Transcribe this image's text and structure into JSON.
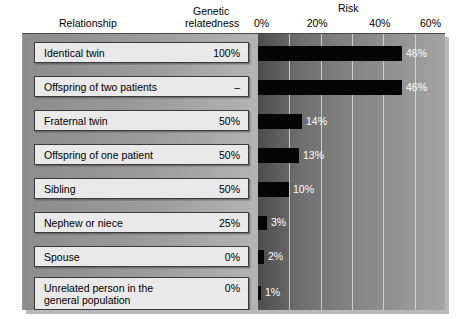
{
  "header": {
    "relationship": "Relationship",
    "genetic_line1": "Genetic",
    "genetic_line2": "relatedness",
    "risk": "Risk"
  },
  "chart_data": {
    "type": "bar",
    "orientation": "horizontal",
    "title": "Risk",
    "xlabel": "Risk",
    "ylabel": "Relationship",
    "xlim": [
      0,
      60
    ],
    "xticks": [
      "0%",
      "20%",
      "40%",
      "60%"
    ],
    "xtick_values": [
      0,
      20,
      40,
      60
    ],
    "gridlines": [
      10,
      20,
      30,
      40,
      50
    ],
    "grid": true,
    "legend": "none",
    "columns": [
      "Relationship",
      "Genetic relatedness",
      "Risk"
    ],
    "categories": [
      "Identical twin",
      "Offspring of two patients",
      "Fraternal twin",
      "Offspring of one patient",
      "Sibling",
      "Nephew or niece",
      "Spouse",
      "Unrelated person in the general population"
    ],
    "genetic_relatedness": [
      "100%",
      "–",
      "50%",
      "50%",
      "50%",
      "25%",
      "0%",
      "0%"
    ],
    "values": [
      46,
      46,
      14,
      13,
      10,
      3,
      2,
      1
    ],
    "value_labels": [
      "46%",
      "46%",
      "14%",
      "13%",
      "10%",
      "3%",
      "2%",
      "1%"
    ],
    "rows": [
      {
        "label": "Identical twin",
        "label_line2": "",
        "relatedness": "100%",
        "risk": 46,
        "risk_label": "46%"
      },
      {
        "label": "Offspring of two patients",
        "label_line2": "",
        "relatedness": "–",
        "risk": 46,
        "risk_label": "46%"
      },
      {
        "label": "Fraternal twin",
        "label_line2": "",
        "relatedness": "50%",
        "risk": 14,
        "risk_label": "14%"
      },
      {
        "label": "Offspring of one patient",
        "label_line2": "",
        "relatedness": "50%",
        "risk": 13,
        "risk_label": "13%"
      },
      {
        "label": "Sibling",
        "label_line2": "",
        "relatedness": "50%",
        "risk": 10,
        "risk_label": "10%"
      },
      {
        "label": "Nephew or niece",
        "label_line2": "",
        "relatedness": "25%",
        "risk": 3,
        "risk_label": "3%"
      },
      {
        "label": "Spouse",
        "label_line2": "",
        "relatedness": "0%",
        "risk": 2,
        "risk_label": "2%"
      },
      {
        "label": "Unrelated person in the",
        "label_line2": "general population",
        "relatedness": "0%",
        "risk": 1,
        "risk_label": "1%"
      }
    ]
  },
  "colors": {
    "bar": "#050505",
    "label_box": "#e9e9e9",
    "gridline": "#d9d9d9",
    "value_text": "#ffffff",
    "panel_left": "#9c9c9c",
    "panel_right_dark": "#4d4d4d",
    "panel_right_light": "#a5a5a5"
  }
}
